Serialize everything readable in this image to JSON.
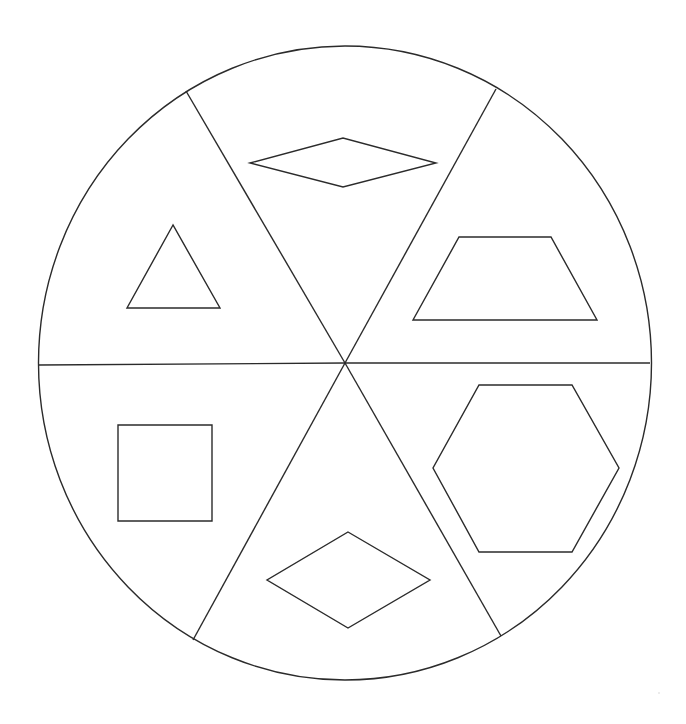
{
  "diagram": {
    "type": "circle-divided-into-six-sectors-with-shapes",
    "stroke_color": "#2b2b2b",
    "background_color": "#ffffff",
    "circle": {
      "cx": 345,
      "cy": 363,
      "rx": 306.5,
      "ry": 317
    },
    "center": {
      "x": 345,
      "y": 363
    },
    "dividers": [
      {
        "name": "upper-left",
        "x1": 345,
        "y1": 363,
        "x2": 186,
        "y2": 91
      },
      {
        "name": "upper-right",
        "x1": 345,
        "y1": 363,
        "x2": 496,
        "y2": 89
      },
      {
        "name": "left-horizontal",
        "x1": 345,
        "y1": 363,
        "x2": 39,
        "y2": 365
      },
      {
        "name": "right-horizontal",
        "x1": 345,
        "y1": 363,
        "x2": 650,
        "y2": 363
      },
      {
        "name": "lower-left",
        "x1": 345,
        "y1": 363,
        "x2": 193,
        "y2": 640
      },
      {
        "name": "lower-right",
        "x1": 345,
        "y1": 363,
        "x2": 501,
        "y2": 636
      }
    ],
    "sectors": [
      {
        "position": "top",
        "shape": "rhombus",
        "sides": 4,
        "points": "250,163 343,138 436,163 343,187"
      },
      {
        "position": "upper-left",
        "shape": "triangle",
        "sides": 3,
        "points": "173,225 127,308 220,308"
      },
      {
        "position": "upper-right",
        "shape": "trapezoid",
        "sides": 4,
        "points": "459,237 551,237 597,320 413,320"
      },
      {
        "position": "lower-left",
        "shape": "square",
        "sides": 4,
        "points": "118,425 212,425 212,521 118,521"
      },
      {
        "position": "bottom",
        "shape": "rhombus",
        "sides": 4,
        "points": "348,532 430,580 348,628 267,580"
      },
      {
        "position": "lower-right",
        "shape": "hexagon",
        "sides": 6,
        "points": "479,385 572,385 619,468 572,552 479,552 433,468"
      }
    ]
  }
}
